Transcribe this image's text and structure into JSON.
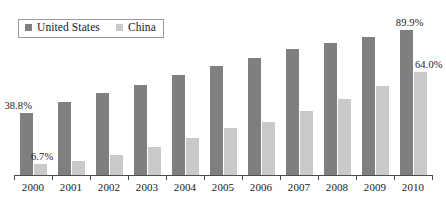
{
  "legend": {
    "position": "top-left",
    "entries": [
      {
        "label": "United States",
        "icon": "square-swatch",
        "color": "#7f7f7f"
      },
      {
        "label": "China",
        "icon": "square-swatch",
        "color": "#c9c9c9"
      }
    ]
  },
  "annotations": [
    {
      "text": "38.8%",
      "series": "United States",
      "category": "2000"
    },
    {
      "text": "6.7%",
      "series": "China",
      "category": "2000"
    },
    {
      "text": "89.9%",
      "series": "United States",
      "category": "2010"
    },
    {
      "text": "64.0%",
      "series": "China",
      "category": "2010"
    }
  ],
  "colors": {
    "united_states": "#7f7f7f",
    "china": "#c9c9c9",
    "axis": "#4d4d4d",
    "text": "#1a1a1a",
    "background": "#ffffff"
  },
  "chart_data": {
    "type": "bar",
    "title": "",
    "subtitle": "",
    "xlabel": "",
    "ylabel": "",
    "grid": false,
    "legend_position": "top-left",
    "ylim": [
      0,
      100
    ],
    "categories": [
      "2000",
      "2001",
      "2002",
      "2003",
      "2004",
      "2005",
      "2006",
      "2007",
      "2008",
      "2009",
      "2010"
    ],
    "series": [
      {
        "name": "United States",
        "color": "#7f7f7f",
        "values": [
          38.8,
          45.5,
          51.0,
          56.0,
          62.0,
          68.0,
          72.5,
          78.0,
          82.0,
          86.0,
          89.9
        ]
      },
      {
        "name": "China",
        "color": "#c9c9c9",
        "values": [
          6.7,
          9.0,
          12.5,
          17.5,
          23.0,
          29.0,
          33.0,
          40.0,
          47.5,
          55.0,
          64.0
        ]
      }
    ]
  }
}
